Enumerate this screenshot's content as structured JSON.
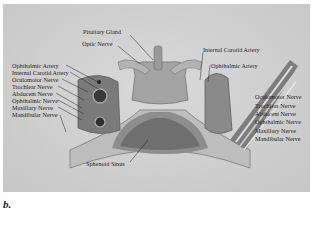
{
  "figure": {
    "panel_letter": "b.",
    "labels_center": {
      "pituitary_gland": "Pituitary Gland",
      "optic_nerve": "Optic Nerve",
      "sphenoid_sinus": "Sphenoid Sinus"
    },
    "labels_left": [
      "Ophthalmic Artery",
      "Internal Carotid Artery",
      "Oculomotor Nerve",
      "Trochlear Nerve",
      "Abducent Nerve",
      "Ophthalmic Nerve",
      "Maxillary Nerve",
      "Mandibular Nerve"
    ],
    "labels_right": [
      "Internal Carotid Artery",
      "Ophthalmic Artery",
      "Oculomotor Nerve",
      "Trochlear Nerve",
      "Abducent Nerve",
      "Ophthalmic Nerve",
      "Maxillary Nerve",
      "Mandibular Nerve"
    ],
    "colors": {
      "background": "#d2d2d2",
      "bone": "#b9b9b9",
      "tissue_dark": "#6e6e6e",
      "label_text": "#1e1e1e"
    }
  }
}
